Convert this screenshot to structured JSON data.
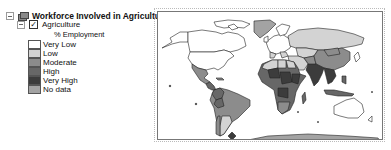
{
  "toc": {
    "group": {
      "title": "Workforce Involved in Agriculture",
      "expanded": true,
      "icon": "layers-icon"
    },
    "layer": {
      "name": "Agriculture",
      "checked": true,
      "check_glyph": "✓",
      "expanded": true,
      "field": "% Employment"
    },
    "legend": [
      {
        "label": "Very Low",
        "color": "#ffffff"
      },
      {
        "label": "Low",
        "color": "#d3d3d3"
      },
      {
        "label": "Moderate",
        "color": "#8c8c8c"
      },
      {
        "label": "High",
        "color": "#676767"
      },
      {
        "label": "Very High",
        "color": "#3c3c3c"
      },
      {
        "label": "No data",
        "color": "#a3a3a3"
      }
    ]
  },
  "map": {
    "title": "World map — percentage of workforce employed in agriculture",
    "colors": {
      "very_low": "#ffffff",
      "low": "#d3d3d3",
      "moderate": "#8c8c8c",
      "high": "#676767",
      "very_high": "#3c3c3c",
      "no_data": "#a3a3a3",
      "border": "#222222"
    }
  }
}
